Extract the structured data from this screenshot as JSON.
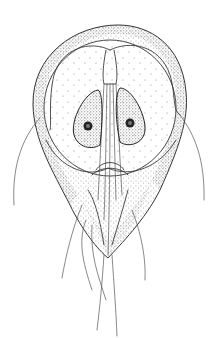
{
  "figure": {
    "style": "stippled pen-and-ink line drawing",
    "background": "#ffffff",
    "ink_color": "#3a3a3a",
    "stipple_color": "#555555",
    "structures": [
      "body",
      "adhesive-disc",
      "nucleus-left",
      "nucleus-right",
      "axonemes",
      "median-body",
      "flagella"
    ]
  }
}
